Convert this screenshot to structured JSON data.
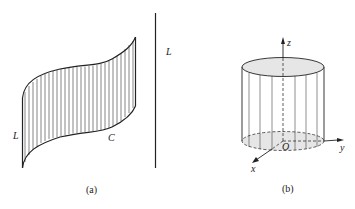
{
  "figure": {
    "panel_a": {
      "caption": "(a)",
      "labels": {
        "left_generator": "L",
        "curve": "C",
        "line": "L"
      }
    },
    "panel_b": {
      "caption": "(b)",
      "axes": {
        "z": "z",
        "y": "y",
        "x": "x",
        "origin": "O"
      }
    },
    "colors": {
      "stroke": "#222222",
      "fill_gray": "#e6e6e6"
    }
  }
}
